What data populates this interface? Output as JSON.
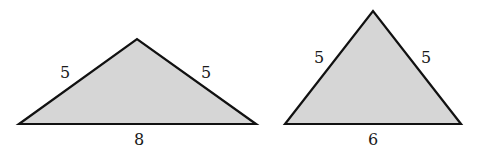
{
  "figure": {
    "triangles": [
      {
        "name": "obtuse-isosceles-triangle",
        "sides": {
          "left": "5",
          "right": "5",
          "base": "8"
        },
        "points": "19,124 137,39 256,124",
        "label_pos": {
          "left": [
            65,
            73
          ],
          "right": [
            206,
            73
          ],
          "base": [
            139,
            140
          ]
        }
      },
      {
        "name": "acute-isosceles-triangle",
        "sides": {
          "left": "5",
          "right": "5",
          "base": "6"
        },
        "points": "285,124 373,11 461,124",
        "label_pos": {
          "left": [
            319,
            58
          ],
          "right": [
            426,
            58
          ],
          "base": [
            373,
            140
          ]
        }
      }
    ],
    "colors": {
      "fill": "#d6d6d6",
      "stroke": "#111111",
      "background": "#ffffff"
    }
  }
}
